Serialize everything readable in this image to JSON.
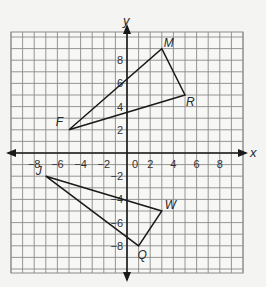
{
  "diagram": {
    "type": "coordinate-plane",
    "axis_labels": {
      "x": "x",
      "y": "y"
    },
    "x_range": [
      -10,
      10
    ],
    "y_range": [
      -10.3,
      10.4
    ],
    "grid_step": 1,
    "tick_step": 2,
    "x_ticks": [
      {
        "v": -8,
        "label": "−8"
      },
      {
        "v": -6,
        "label": "−6"
      },
      {
        "v": -4,
        "label": "−4"
      },
      {
        "v": -2,
        "label": "−2"
      },
      {
        "v": 0,
        "label": "0"
      },
      {
        "v": 2,
        "label": "2"
      },
      {
        "v": 4,
        "label": "4"
      },
      {
        "v": 6,
        "label": "6"
      },
      {
        "v": 8,
        "label": "8"
      }
    ],
    "y_ticks": [
      {
        "v": 8,
        "label": "8"
      },
      {
        "v": 6,
        "label": "6"
      },
      {
        "v": 4,
        "label": "4"
      },
      {
        "v": 2,
        "label": "2"
      },
      {
        "v": -2,
        "label": "−2"
      },
      {
        "v": -4,
        "label": "−4"
      },
      {
        "v": -6,
        "label": "−6"
      },
      {
        "v": -8,
        "label": "−8"
      }
    ],
    "triangles": [
      {
        "name": "triangle-FMR",
        "vertices": [
          {
            "label": "F",
            "x": -5,
            "y": 2,
            "lx": -6,
            "ly": -4,
            "anchor": "end"
          },
          {
            "label": "M",
            "x": 3,
            "y": 9,
            "lx": 2,
            "ly": -2,
            "anchor": "start"
          },
          {
            "label": "R",
            "x": 5,
            "y": 5,
            "lx": 1,
            "ly": 11,
            "anchor": "start"
          }
        ]
      },
      {
        "name": "triangle-JWQ",
        "vertices": [
          {
            "label": "J",
            "x": -7,
            "y": -2,
            "lx": -4,
            "ly": -1,
            "anchor": "end"
          },
          {
            "label": "W",
            "x": 3,
            "y": -5,
            "lx": 3,
            "ly": -2,
            "anchor": "start"
          },
          {
            "label": "Q",
            "x": 1,
            "y": -8,
            "lx": -1,
            "ly": 13,
            "anchor": "start"
          }
        ]
      }
    ],
    "colors": {
      "grid": "#8a8a8a",
      "axis": "#1a1a1a",
      "shape": "#1a1a1a",
      "background": "#f4f4f2"
    }
  }
}
